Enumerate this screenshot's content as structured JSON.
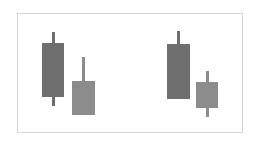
{
  "chart_data": {
    "type": "candlestick",
    "title": "",
    "xlabel": "",
    "ylabel": "",
    "grid": false,
    "legend": null,
    "pixel_space": true,
    "groups": [
      {
        "name": "left-pair",
        "candles": [
          {
            "x": 53,
            "high": 32,
            "body_top": 43,
            "body_bottom": 97,
            "low": 106,
            "width": 22,
            "color": "#6e6e6e"
          },
          {
            "x": 83,
            "high": 57,
            "body_top": 81,
            "body_bottom": 115,
            "low": 115,
            "width": 23,
            "color": "#8c8c8c"
          }
        ]
      },
      {
        "name": "right-pair",
        "candles": [
          {
            "x": 178,
            "high": 31,
            "body_top": 44,
            "body_bottom": 99,
            "low": 99,
            "width": 23,
            "color": "#6e6e6e"
          },
          {
            "x": 207,
            "high": 71,
            "body_top": 82,
            "body_bottom": 108,
            "low": 117,
            "width": 22,
            "color": "#8c8c8c"
          }
        ]
      }
    ]
  },
  "colors": {
    "frame_border": "#d4d4d4",
    "dark_candle": "#6e6e6e",
    "light_candle": "#8c8c8c"
  }
}
